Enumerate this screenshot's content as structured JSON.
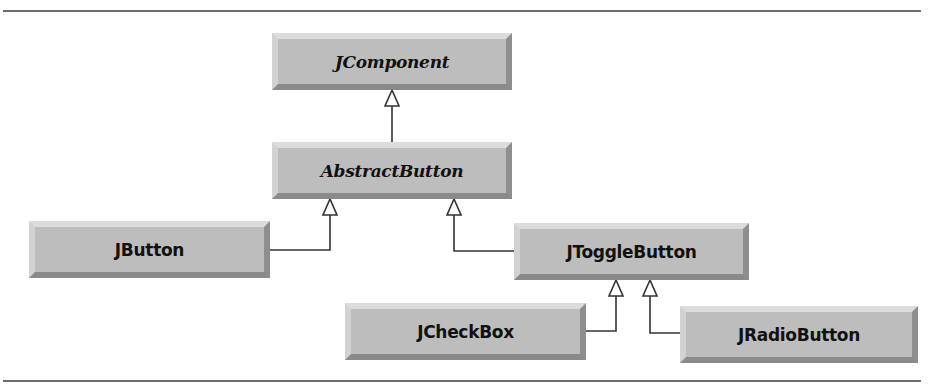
{
  "diagram": {
    "type": "UML class hierarchy",
    "classes": [
      {
        "id": "jcomponent",
        "label": "JComponent",
        "abstract": true,
        "parent": null
      },
      {
        "id": "abstractbutton",
        "label": "AbstractButton",
        "abstract": true,
        "parent": "JComponent"
      },
      {
        "id": "jbutton",
        "label": "JButton",
        "abstract": false,
        "parent": "AbstractButton"
      },
      {
        "id": "jtogglebutton",
        "label": "JToggleButton",
        "abstract": false,
        "parent": "AbstractButton"
      },
      {
        "id": "jcheckbox",
        "label": "JCheckBox",
        "abstract": false,
        "parent": "JToggleButton"
      },
      {
        "id": "jradiobutton",
        "label": "JRadioButton",
        "abstract": false,
        "parent": "JToggleButton"
      }
    ],
    "relationships": [
      {
        "from": "AbstractButton",
        "to": "JComponent",
        "kind": "generalization"
      },
      {
        "from": "JButton",
        "to": "AbstractButton",
        "kind": "generalization"
      },
      {
        "from": "JToggleButton",
        "to": "AbstractButton",
        "kind": "generalization"
      },
      {
        "from": "JCheckBox",
        "to": "JToggleButton",
        "kind": "generalization"
      },
      {
        "from": "JRadioButton",
        "to": "JToggleButton",
        "kind": "generalization"
      }
    ],
    "colors": {
      "box_fill": "#bdbdbd",
      "box_highlight": "#dcdcdc",
      "box_shadow": "#8a8a8a",
      "line": "#333333",
      "rule": "#6a6a6a"
    }
  }
}
